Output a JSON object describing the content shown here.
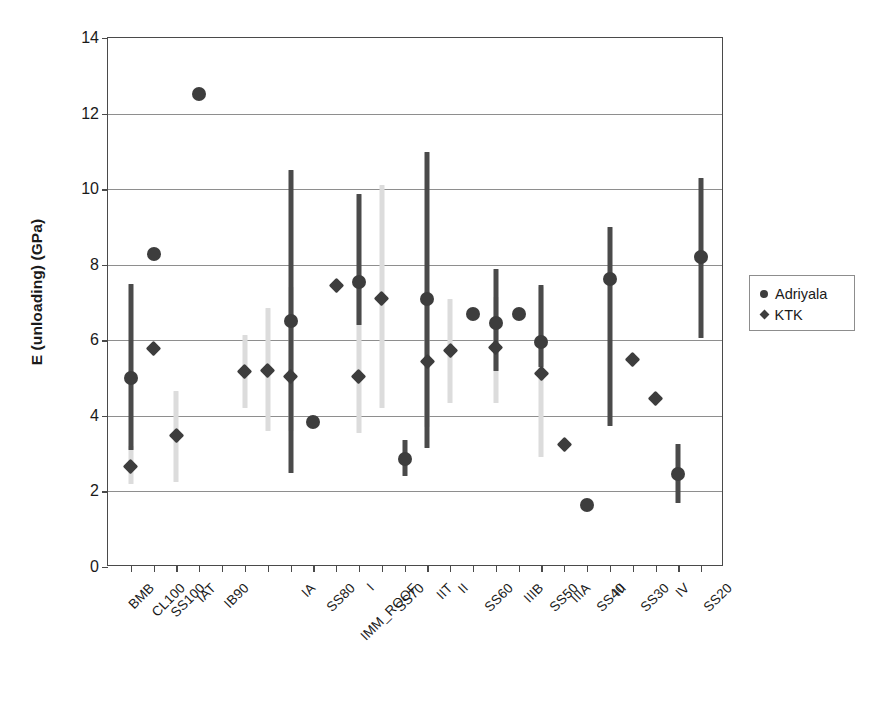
{
  "chart_data": {
    "type": "scatter",
    "title": "",
    "xlabel": "",
    "ylabel": "E (unloading) (GPa)",
    "ylim": [
      0,
      14
    ],
    "yticks": [
      0,
      2,
      4,
      6,
      8,
      10,
      12,
      14
    ],
    "grid": "horizontal",
    "legend_position": "right",
    "legend": [
      {
        "name": "Adriyala",
        "marker": "circle",
        "color": "#3d3d3d"
      },
      {
        "name": "KTK",
        "marker": "diamond",
        "color": "#3d3d3d"
      }
    ],
    "x_tick_count": 26,
    "categories": [
      "BMB",
      "CL100",
      "SS100",
      "IAT",
      "IB90",
      "",
      "IA",
      "SS80",
      "IMM_ROOF",
      "I",
      "SS70",
      "IIT",
      "II",
      "SS60",
      "IIIB",
      "SS50",
      "IIIA",
      "SS40",
      "III",
      "SS30",
      "IV",
      "SS20"
    ],
    "category_labels_rotated": true,
    "points": [
      {
        "slot": 1,
        "label": "BMB",
        "series": "Adriyala",
        "value": 5.0,
        "err_low": 3.1,
        "err_high": 7.5
      },
      {
        "slot": 1,
        "label": "BMB",
        "series": "KTK",
        "value": 2.65,
        "err_low": 2.2,
        "err_high": 3.2
      },
      {
        "slot": 2,
        "label": "CL100",
        "series": "Adriyala",
        "value": 8.28,
        "err_low": null,
        "err_high": null
      },
      {
        "slot": 2,
        "label": "CL100",
        "series": "KTK",
        "value": 5.78,
        "err_low": null,
        "err_high": null
      },
      {
        "slot": 3,
        "label": "SS100",
        "series": "KTK",
        "value": 3.48,
        "err_low": 2.25,
        "err_high": 4.65
      },
      {
        "slot": 4,
        "label": "IAT",
        "series": "Adriyala",
        "value": 12.52,
        "err_low": null,
        "err_high": null
      },
      {
        "slot": 6,
        "label": "IB90",
        "series": "KTK",
        "value": 5.18,
        "err_low": 4.2,
        "err_high": 6.15
      },
      {
        "slot": 7,
        "label": "IA",
        "series": "KTK",
        "value": 5.2,
        "err_low": 3.6,
        "err_high": 6.85
      },
      {
        "slot": 8,
        "label": "SS80",
        "series": "Adriyala",
        "value": 6.5,
        "err_low": 2.5,
        "err_high": 10.5
      },
      {
        "slot": 8,
        "label": "SS80",
        "series": "KTK",
        "value": 5.05,
        "err_low": 3.6,
        "err_high": 7.4
      },
      {
        "slot": 9,
        "label": "IMM_ROOF",
        "series": "Adriyala",
        "value": 3.85,
        "err_low": null,
        "err_high": null
      },
      {
        "slot": 10,
        "label": "I",
        "series": "KTK",
        "value": 7.45,
        "err_low": null,
        "err_high": null
      },
      {
        "slot": 11,
        "label": "SS70",
        "series": "Adriyala",
        "value": 7.55,
        "err_low": 6.4,
        "err_high": 9.88
      },
      {
        "slot": 11,
        "label": "SS70",
        "series": "KTK",
        "value": 5.03,
        "err_low": 3.55,
        "err_high": 7.45
      },
      {
        "slot": 12,
        "label": "IIT",
        "series": "KTK",
        "value": 7.1,
        "err_low": 4.2,
        "err_high": 10.1
      },
      {
        "slot": 13,
        "label": "II",
        "series": "Adriyala",
        "value": 2.85,
        "err_low": 2.4,
        "err_high": 3.35
      },
      {
        "slot": 14,
        "label": "SS60",
        "series": "Adriyala",
        "value": 7.1,
        "err_low": 3.15,
        "err_high": 10.98
      },
      {
        "slot": 14,
        "label": "SS60",
        "series": "KTK",
        "value": 5.45,
        "err_low": 3.7,
        "err_high": 7.3
      },
      {
        "slot": 15,
        "label": "IIIB",
        "series": "KTK",
        "value": 5.73,
        "err_low": 4.35,
        "err_high": 7.1
      },
      {
        "slot": 16,
        "label": "SS50",
        "series": "Adriyala",
        "value": 6.7,
        "err_low": null,
        "err_high": null
      },
      {
        "slot": 17,
        "label": "IIIA",
        "series": "Adriyala",
        "value": 6.45,
        "err_low": 5.2,
        "err_high": 7.88
      },
      {
        "slot": 17,
        "label": "IIIA",
        "series": "KTK",
        "value": 5.8,
        "err_low": 4.35,
        "err_high": 7.15
      },
      {
        "slot": 18,
        "label": "SS40",
        "series": "Adriyala",
        "value": 6.7,
        "err_low": null,
        "err_high": null
      },
      {
        "slot": 19,
        "label": "III",
        "series": "Adriyala",
        "value": 5.95,
        "err_low": 5.3,
        "err_high": 7.45
      },
      {
        "slot": 19,
        "label": "III",
        "series": "KTK",
        "value": 5.13,
        "err_low": 2.9,
        "err_high": 7.4
      },
      {
        "slot": 20,
        "label": "SS30",
        "series": "KTK",
        "value": 3.25,
        "err_low": null,
        "err_high": null
      },
      {
        "slot": 21,
        "label": "IV",
        "series": "Adriyala",
        "value": 1.65,
        "err_low": null,
        "err_high": null
      },
      {
        "slot": 22,
        "label": "SS20",
        "series": "Adriyala",
        "value": 7.62,
        "err_low": 3.72,
        "err_high": 9.0
      },
      {
        "slot": 23,
        "label": "SS20b",
        "series": "KTK",
        "value": 5.48,
        "err_low": null,
        "err_high": null
      },
      {
        "slot": 24,
        "label": "IV2",
        "series": "KTK",
        "value": 4.45,
        "err_low": null,
        "err_high": null
      },
      {
        "slot": 25,
        "label": "SS20c",
        "series": "Adriyala",
        "value": 2.45,
        "err_low": 1.7,
        "err_high": 3.25
      },
      {
        "slot": 26,
        "label": "SS20d",
        "series": "Adriyala",
        "value": 8.2,
        "err_low": 6.05,
        "err_high": 10.3
      }
    ]
  },
  "axis": {
    "y_title": "E (unloading) (GPa)",
    "y_tick_labels": [
      "0",
      "2",
      "4",
      "6",
      "8",
      "10",
      "12",
      "14"
    ]
  },
  "legend": {
    "items": [
      {
        "label": "Adriyala",
        "marker": "circle"
      },
      {
        "label": "KTK",
        "marker": "diamond"
      }
    ]
  },
  "x_labels": [
    {
      "text": "BMB",
      "slot": 1
    },
    {
      "text": "CL100",
      "slot": 2
    },
    {
      "text": "SS100",
      "slot": 3
    },
    {
      "text": "IAT",
      "slot": 4.6
    },
    {
      "text": "IB90",
      "slot": 5.9
    },
    {
      "text": "IA",
      "slot": 10.1
    },
    {
      "text": "SS80",
      "slot": 11.1
    },
    {
      "text": "IMM_ROOF",
      "slot": 12.2
    },
    {
      "text": "I",
      "slot": 13.6
    },
    {
      "text": "SS70",
      "slot": 14.6
    },
    {
      "text": "IIT",
      "slot": 17.0
    },
    {
      "text": "II",
      "slot": 18.2
    },
    {
      "text": "SS60",
      "slot": 19.2
    },
    {
      "text": "IIIB",
      "slot": 21.4
    },
    {
      "text": "SS50",
      "slot": 22.5
    },
    {
      "text": "IIIA",
      "slot": 23.8
    },
    {
      "text": "SS40",
      "slot": 24.9
    },
    {
      "text": "III",
      "slot": 26.1
    },
    {
      "text": "SS30",
      "slot": 27.2
    },
    {
      "text": "IV",
      "slot": 29.3
    },
    {
      "text": "SS20",
      "slot": 30.4
    }
  ]
}
